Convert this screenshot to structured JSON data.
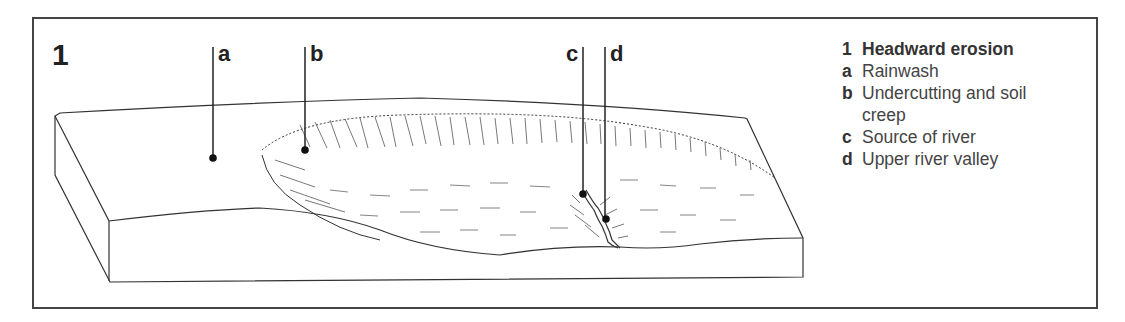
{
  "figure": {
    "number": "1",
    "callouts": [
      {
        "key": "a"
      },
      {
        "key": "b"
      },
      {
        "key": "c"
      },
      {
        "key": "d"
      }
    ]
  },
  "legend": {
    "title_key": "1",
    "title": "Headward erosion",
    "items": [
      {
        "key": "a",
        "text": "Rainwash"
      },
      {
        "key": "b",
        "text": "Undercutting and soil creep"
      },
      {
        "key": "c",
        "text": "Source of river"
      },
      {
        "key": "d",
        "text": "Upper river valley"
      }
    ]
  },
  "colors": {
    "line": "#333333",
    "frame": "#444444"
  }
}
